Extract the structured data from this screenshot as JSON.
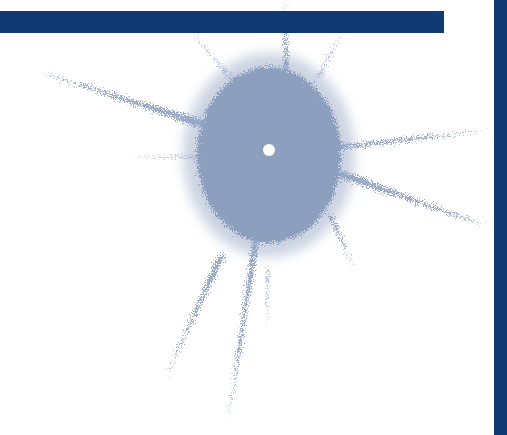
{
  "graphic": {
    "description": "Decorative ink splat illustration with navy frame bars",
    "colors": {
      "background": "#ffffff",
      "bar": "#0f3a73",
      "splat": "#8d9fbf",
      "center_dot": "#ffffff"
    },
    "horizontal_bar": {
      "x": 0,
      "y": 11,
      "width": 444,
      "height": 22
    },
    "vertical_bar": {
      "x": 494,
      "y": 0,
      "width": 13,
      "height": 435
    },
    "splat": {
      "center": [
        269,
        150
      ],
      "rx": 72,
      "ry": 88,
      "rays": [
        {
          "from": [
            215,
            128
          ],
          "to": [
            40,
            72
          ],
          "width": 9
        },
        {
          "from": [
            205,
            157
          ],
          "to": [
            125,
            157
          ],
          "width": 3
        },
        {
          "from": [
            340,
            147
          ],
          "to": [
            492,
            130
          ],
          "width": 5
        },
        {
          "from": [
            335,
            172
          ],
          "to": [
            492,
            228
          ],
          "width": 8
        },
        {
          "from": [
            256,
            240
          ],
          "to": [
            228,
            420
          ],
          "width": 6
        },
        {
          "from": [
            222,
            255
          ],
          "to": [
            163,
            382
          ],
          "width": 6
        },
        {
          "from": [
            268,
            270
          ],
          "to": [
            267,
            330
          ],
          "width": 3
        },
        {
          "from": [
            286,
            70
          ],
          "to": [
            286,
            0
          ],
          "width": 5
        },
        {
          "from": [
            232,
            80
          ],
          "to": [
            190,
            30
          ],
          "width": 3
        },
        {
          "from": [
            318,
            78
          ],
          "to": [
            345,
            25
          ],
          "width": 3
        },
        {
          "from": [
            330,
            215
          ],
          "to": [
            355,
            270
          ],
          "width": 4
        }
      ]
    }
  }
}
